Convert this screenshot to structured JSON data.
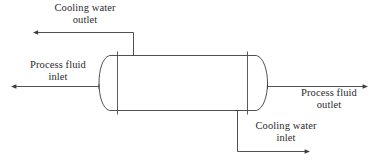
{
  "figure": {
    "type": "process-flow-diagram",
    "background_color": "#ffffff",
    "line_color": "#3d3d3d",
    "text_color": "#2b2b2b"
  },
  "labels": {
    "cooling_water_outlet": {
      "line1": "Cooling water",
      "line2": "outlet"
    },
    "process_fluid_inlet": {
      "line1": "Process fluid",
      "line2": "inlet"
    },
    "process_fluid_outlet": {
      "line1": "Process fluid",
      "line2": "outlet"
    },
    "cooling_water_inlet": {
      "line1": "Cooling water",
      "line2": "inlet"
    }
  },
  "streams": [
    {
      "name": "cooling-water-outlet-stream",
      "direction": "left",
      "label": "Cooling water outlet"
    },
    {
      "name": "process-fluid-inlet-stream",
      "direction": "left",
      "label": "Process fluid inlet"
    },
    {
      "name": "process-fluid-outlet-stream",
      "direction": "right",
      "label": "Process fluid outlet"
    },
    {
      "name": "cooling-water-inlet-stream",
      "direction": "right",
      "label": "Cooling water inlet"
    }
  ],
  "equipment": {
    "name": "horizontal-vessel",
    "head_type": "dished",
    "internals": "two tube sheets"
  }
}
